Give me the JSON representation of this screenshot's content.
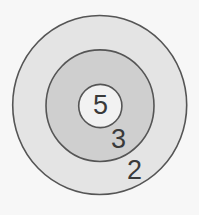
{
  "diagram": {
    "type": "concentric-target",
    "rings": [
      {
        "id": "outer",
        "label": "2",
        "fill": "#e4e4e4"
      },
      {
        "id": "middle",
        "label": "3",
        "fill": "#cfcfcf"
      },
      {
        "id": "inner",
        "label": "5",
        "fill": "#f2f2f2"
      }
    ],
    "colors": {
      "background": "#f7f7f7",
      "stroke": "#555555",
      "text": "#3a3a3a"
    }
  }
}
